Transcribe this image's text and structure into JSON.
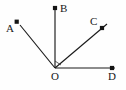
{
  "diagram": {
    "type": "ray-diagram",
    "canvas": {
      "width": 126,
      "height": 90,
      "background": "#fefefe"
    },
    "stroke_color": "#1a1a1a",
    "label_color": "#171717",
    "origin": {
      "name": "O",
      "x": 55,
      "y": 68
    },
    "points": [
      {
        "id": "A",
        "label": "A",
        "tip_x": 17,
        "tip_y": 22,
        "label_x": 6,
        "label_y": 23,
        "marker": "dot"
      },
      {
        "id": "B",
        "label": "B",
        "tip_x": 55,
        "tip_y": 8,
        "label_x": 60,
        "label_y": 3,
        "marker": "dot"
      },
      {
        "id": "C",
        "label": "C",
        "tip_x": 102,
        "tip_y": 28,
        "label_x": 90,
        "label_y": 16,
        "marker": "dot"
      },
      {
        "id": "D",
        "label": "D",
        "tip_x": 112,
        "tip_y": 68,
        "label_x": 108,
        "label_y": 71,
        "marker": "dot"
      },
      {
        "id": "O",
        "label": "O",
        "tip_x": 55,
        "tip_y": 68,
        "label_x": 51,
        "label_y": 71,
        "marker": "vertex"
      }
    ],
    "rays": [
      {
        "id": "OA",
        "from": "O",
        "to": "A",
        "x1": 55,
        "y1": 68,
        "x2": 20,
        "y2": 25
      },
      {
        "id": "OB",
        "from": "O",
        "to": "B",
        "x1": 55,
        "y1": 68,
        "x2": 55,
        "y2": 8
      },
      {
        "id": "OC",
        "from": "O",
        "to": "C",
        "x1": 55,
        "y1": 68,
        "x2": 107,
        "y2": 24
      },
      {
        "id": "OD",
        "from": "O",
        "to": "D",
        "x1": 55,
        "y1": 68,
        "x2": 115,
        "y2": 68
      }
    ],
    "angle_marker": {
      "id": "angle-BOC",
      "description": "small angle tick between ray OB and ray OC at the vertex",
      "path": "M 55 61 L 61 65"
    }
  }
}
